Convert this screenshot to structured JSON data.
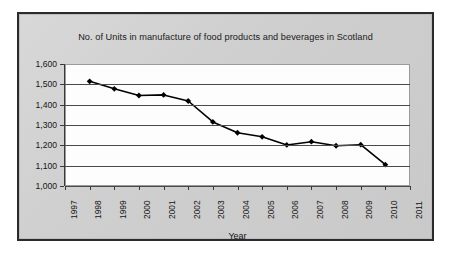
{
  "chart_data": {
    "type": "line",
    "title": "No. of Units in manufacture of food products and beverages in Scotland",
    "xlabel": "Year",
    "ylabel": "",
    "categories": [
      "1997",
      "1998",
      "1999",
      "2000",
      "2001",
      "2002",
      "2003",
      "2004",
      "2005",
      "2006",
      "2007",
      "2008",
      "2009",
      "2010",
      "2011"
    ],
    "values": [
      null,
      1515,
      1478,
      1445,
      1448,
      1418,
      1315,
      1262,
      1242,
      1202,
      1218,
      1198,
      1203,
      1105,
      null
    ],
    "series": [
      {
        "name": "No. of Units",
        "points": [
          {
            "x": "1998",
            "y": 1515
          },
          {
            "x": "1999",
            "y": 1478
          },
          {
            "x": "2000",
            "y": 1445
          },
          {
            "x": "2001",
            "y": 1448
          },
          {
            "x": "2002",
            "y": 1418
          },
          {
            "x": "2003",
            "y": 1315
          },
          {
            "x": "2004",
            "y": 1262
          },
          {
            "x": "2005",
            "y": 1242
          },
          {
            "x": "2006",
            "y": 1202
          },
          {
            "x": "2007",
            "y": 1218
          },
          {
            "x": "2008",
            "y": 1198
          },
          {
            "x": "2009",
            "y": 1203
          },
          {
            "x": "2010",
            "y": 1105
          }
        ]
      }
    ],
    "ylim": [
      1000,
      1600
    ],
    "ytick_step": 100,
    "ytick_labels": [
      "1,600",
      "1,500",
      "1,400",
      "1,300",
      "1,200",
      "1,100",
      "1,000"
    ],
    "ytick_values": [
      1600,
      1500,
      1400,
      1300,
      1200,
      1100,
      1000
    ],
    "grid": true,
    "legend": false,
    "marker": "diamond",
    "line_color": "#000000",
    "marker_color": "#000000",
    "grid_color": "#4a4a4a",
    "plot_background": "#fdfdfd",
    "frame_background": "#d2d2d2",
    "frame_border_color": "#2b2b2b"
  }
}
